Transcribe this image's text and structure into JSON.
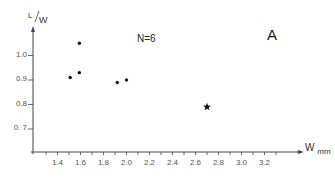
{
  "chart_data": {
    "type": "scatter",
    "title": "",
    "panel_label": "A",
    "annotation": "N=6",
    "xlabel": "W",
    "xlabel_sub": "mm",
    "ylabel_top": "L",
    "ylabel_bottom": "W",
    "xlim": [
      1.2,
      3.4
    ],
    "ylim": [
      0.61,
      1.15
    ],
    "x_ticks": [
      1.4,
      1.6,
      1.8,
      2.0,
      2.2,
      2.4,
      2.6,
      2.8,
      3.0,
      3.2
    ],
    "x_tick_labels": [
      "1.4",
      "1.6",
      "1.8",
      "2.0",
      "2.2",
      "2.4",
      "2.6",
      "2.8",
      "3.0",
      "3.2"
    ],
    "y_ticks": [
      0.7,
      0.8,
      0.9,
      1.0
    ],
    "y_tick_labels": [
      "0. 7",
      "0.8",
      "0.9",
      "1.0"
    ],
    "grid": false,
    "legend": null,
    "series": [
      {
        "name": "samples",
        "marker": "dot",
        "points": [
          {
            "x": 1.51,
            "y": 0.91
          },
          {
            "x": 1.59,
            "y": 1.05
          },
          {
            "x": 1.59,
            "y": 0.93
          },
          {
            "x": 1.92,
            "y": 0.89
          },
          {
            "x": 2.0,
            "y": 0.9
          }
        ]
      },
      {
        "name": "reference",
        "marker": "star",
        "points": [
          {
            "x": 2.7,
            "y": 0.79
          }
        ]
      }
    ]
  },
  "colors": {
    "axis": "#444444",
    "marker": "#111111",
    "text": "#333333"
  }
}
